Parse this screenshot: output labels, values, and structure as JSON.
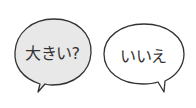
{
  "bubbles": [
    {
      "text": "大きい?",
      "fill": "#e8e8e8",
      "stroke": "#333333",
      "tail": "bottom-left"
    },
    {
      "text": "いいえ",
      "fill": "#ffffff",
      "stroke": "#333333",
      "tail": "bottom-right"
    }
  ]
}
